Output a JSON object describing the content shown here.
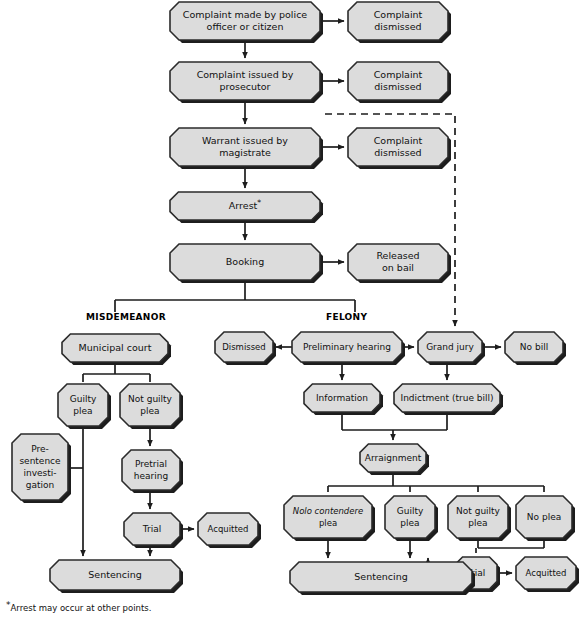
{
  "diagram": {
    "footnote_marker": "*",
    "footnote_text": "Arrest may occur at other points.",
    "colors": {
      "node_fill": "#dcdcdc",
      "node_stroke": "#2b2b2b",
      "shadow": "#1d1d1d",
      "connector": "#1d1d1d",
      "background": "#ffffff",
      "text": "#111111"
    }
  },
  "branch_labels": [
    {
      "id": "misdemeanor",
      "text": "MISDEMEANOR",
      "x": 86,
      "y": 320
    },
    {
      "id": "felony",
      "text": "FELONY",
      "x": 326,
      "y": 320
    }
  ],
  "nodes": [
    {
      "id": "complaint-made",
      "lines": [
        "Complaint made by police",
        "officer or citizen"
      ],
      "x": 170,
      "y": 2,
      "w": 150,
      "h": 38,
      "font": 9.5
    },
    {
      "id": "complaint-dismissed-1",
      "lines": [
        "Complaint",
        "dismissed"
      ],
      "x": 348,
      "y": 2,
      "w": 100,
      "h": 38,
      "font": 9.5
    },
    {
      "id": "complaint-issued",
      "lines": [
        "Complaint issued by",
        "prosecutor"
      ],
      "x": 170,
      "y": 62,
      "w": 150,
      "h": 38,
      "font": 9.5
    },
    {
      "id": "complaint-dismissed-2",
      "lines": [
        "Complaint",
        "dismissed"
      ],
      "x": 348,
      "y": 62,
      "w": 100,
      "h": 38,
      "font": 9.5
    },
    {
      "id": "warrant-issued",
      "lines": [
        "Warrant issued by",
        "magistrate"
      ],
      "x": 170,
      "y": 128,
      "w": 150,
      "h": 38,
      "font": 9.5
    },
    {
      "id": "complaint-dismissed-3",
      "lines": [
        "Complaint",
        "dismissed"
      ],
      "x": 348,
      "y": 128,
      "w": 100,
      "h": 38,
      "font": 9.5
    },
    {
      "id": "arrest",
      "lines": [
        "Arrest*"
      ],
      "x": 170,
      "y": 192,
      "w": 150,
      "h": 28,
      "font": 9.5
    },
    {
      "id": "booking",
      "lines": [
        "Booking"
      ],
      "x": 170,
      "y": 244,
      "w": 150,
      "h": 36,
      "font": 9.5
    },
    {
      "id": "released-on-bail",
      "lines": [
        "Released",
        "on bail"
      ],
      "x": 348,
      "y": 244,
      "w": 100,
      "h": 36,
      "font": 9.5
    },
    {
      "id": "municipal-court",
      "lines": [
        "Municipal court"
      ],
      "x": 62,
      "y": 334,
      "w": 106,
      "h": 28,
      "font": 9.5
    },
    {
      "id": "dismissed",
      "lines": [
        "Dismissed"
      ],
      "x": 215,
      "y": 332,
      "w": 58,
      "h": 30,
      "font": 8.5
    },
    {
      "id": "preliminary-hearing",
      "lines": [
        "Preliminary hearing"
      ],
      "x": 292,
      "y": 332,
      "w": 110,
      "h": 30,
      "font": 9
    },
    {
      "id": "grand-jury",
      "lines": [
        "Grand jury"
      ],
      "x": 418,
      "y": 332,
      "w": 64,
      "h": 30,
      "font": 9
    },
    {
      "id": "no-bill",
      "lines": [
        "No bill"
      ],
      "x": 505,
      "y": 332,
      "w": 58,
      "h": 30,
      "font": 9
    },
    {
      "id": "guilty-plea-misd",
      "lines": [
        "Guilty",
        "plea"
      ],
      "x": 58,
      "y": 384,
      "w": 50,
      "h": 42,
      "font": 9
    },
    {
      "id": "not-guilty-plea-misd",
      "lines": [
        "Not guilty",
        "plea"
      ],
      "x": 120,
      "y": 384,
      "w": 60,
      "h": 42,
      "font": 9
    },
    {
      "id": "information",
      "lines": [
        "Information"
      ],
      "x": 304,
      "y": 384,
      "w": 76,
      "h": 28,
      "font": 9
    },
    {
      "id": "indictment",
      "lines": [
        "Indictment (true bill)"
      ],
      "x": 394,
      "y": 384,
      "w": 106,
      "h": 28,
      "font": 9
    },
    {
      "id": "presentence-investigation",
      "lines": [
        "Pre-",
        "sentence",
        "investi-",
        "gation"
      ],
      "x": 12,
      "y": 434,
      "w": 56,
      "h": 66,
      "font": 9
    },
    {
      "id": "arraignment",
      "lines": [
        "Arraignment"
      ],
      "x": 360,
      "y": 444,
      "w": 66,
      "h": 28,
      "font": 9
    },
    {
      "id": "pretrial-hearing",
      "lines": [
        "Pretrial",
        "hearing"
      ],
      "x": 122,
      "y": 450,
      "w": 58,
      "h": 40,
      "font": 9
    },
    {
      "id": "nolo-contendere-plea",
      "lines": [
        "Nolo contendere",
        "plea"
      ],
      "x": 284,
      "y": 496,
      "w": 88,
      "h": 42,
      "font": 8.5,
      "italic_first_line": true
    },
    {
      "id": "guilty-plea-felony",
      "lines": [
        "Guilty",
        "plea"
      ],
      "x": 385,
      "y": 496,
      "w": 50,
      "h": 42,
      "font": 9
    },
    {
      "id": "not-guilty-plea-felony",
      "lines": [
        "Not guilty",
        "plea"
      ],
      "x": 448,
      "y": 496,
      "w": 60,
      "h": 42,
      "font": 9
    },
    {
      "id": "no-plea",
      "lines": [
        "No plea"
      ],
      "x": 516,
      "y": 496,
      "w": 56,
      "h": 42,
      "font": 9
    },
    {
      "id": "trial-misd",
      "lines": [
        "Trial"
      ],
      "x": 124,
      "y": 513,
      "w": 56,
      "h": 32,
      "font": 9
    },
    {
      "id": "acquitted-misd",
      "lines": [
        "Acquitted"
      ],
      "x": 198,
      "y": 513,
      "w": 60,
      "h": 32,
      "font": 8.5
    },
    {
      "id": "trial-felony",
      "lines": [
        "Trial"
      ],
      "x": 455,
      "y": 557,
      "w": 42,
      "h": 32,
      "font": 9
    },
    {
      "id": "acquitted-felony",
      "lines": [
        "Acquitted"
      ],
      "x": 516,
      "y": 557,
      "w": 60,
      "h": 32,
      "font": 8.5
    },
    {
      "id": "sentencing-misd",
      "lines": [
        "Sentencing"
      ],
      "x": 50,
      "y": 560,
      "w": 130,
      "h": 30,
      "font": 9.5
    },
    {
      "id": "sentencing-felony",
      "lines": [
        "Sentencing"
      ],
      "x": 290,
      "y": 562,
      "w": 182,
      "h": 30,
      "font": 9.5
    }
  ],
  "connectors": [
    {
      "id": "complaint-made-to-dismissed-1",
      "type": "arrow",
      "path": "M 320 21 L 344 21"
    },
    {
      "id": "complaint-made-to-issued",
      "type": "arrow",
      "path": "M 245 40 L 245 58"
    },
    {
      "id": "complaint-issued-to-dismissed-2",
      "type": "arrow",
      "path": "M 320 81 L 344 81"
    },
    {
      "id": "complaint-issued-to-warrant",
      "type": "arrow",
      "path": "M 245 100 L 245 124"
    },
    {
      "id": "warrant-to-dismissed-3",
      "type": "arrow",
      "path": "M 320 147 L 344 147"
    },
    {
      "id": "warrant-to-arrest",
      "type": "arrow",
      "path": "M 245 166 L 245 188"
    },
    {
      "id": "arrest-to-booking",
      "type": "arrow",
      "path": "M 245 220 L 245 240"
    },
    {
      "id": "booking-to-released",
      "type": "arrow",
      "path": "M 320 262 L 344 262"
    },
    {
      "id": "booking-to-split",
      "type": "plain",
      "path": "M 245 280 L 245 300"
    },
    {
      "id": "split-bar",
      "type": "plain",
      "path": "M 115 300 L 355 300"
    },
    {
      "id": "split-to-misdemeanor",
      "type": "plain",
      "path": "M 115 300 L 115 312"
    },
    {
      "id": "split-to-felony",
      "type": "plain",
      "path": "M 355 300 L 355 312"
    },
    {
      "id": "dashed-prosecutor-to-grand-jury",
      "type": "dashed-arrow",
      "path": "M 325 114 L 455 114 L 455 326"
    },
    {
      "id": "municipal-court-to-bar",
      "type": "plain",
      "path": "M 115 362 L 115 374"
    },
    {
      "id": "municipal-bar",
      "type": "plain",
      "path": "M 83 374 L 150 374"
    },
    {
      "id": "bar-to-guilty-plea-misd",
      "type": "plain",
      "path": "M 83 374 L 83 382"
    },
    {
      "id": "bar-to-not-guilty-plea-misd",
      "type": "plain",
      "path": "M 150 374 L 150 382"
    },
    {
      "id": "preliminary-to-dismissed",
      "type": "arrow",
      "path": "M 292 347 L 276 347"
    },
    {
      "id": "preliminary-to-grand-jury",
      "type": "arrow",
      "path": "M 402 347 L 414 347"
    },
    {
      "id": "grand-jury-to-no-bill",
      "type": "arrow",
      "path": "M 482 347 L 501 347"
    },
    {
      "id": "preliminary-to-information",
      "type": "arrow",
      "path": "M 342 362 L 342 380"
    },
    {
      "id": "grand-jury-to-indictment",
      "type": "arrow",
      "path": "M 447 362 L 447 380"
    },
    {
      "id": "not-guilty-misd-to-pretrial",
      "type": "arrow",
      "path": "M 150 426 L 150 446"
    },
    {
      "id": "guilty-plea-misd-down",
      "type": "plain",
      "path": "M 83 426 L 83 468"
    },
    {
      "id": "guilty-misd-to-presentence-bar",
      "type": "plain",
      "path": "M 83 468 L 68 468"
    },
    {
      "id": "guilty-misd-to-sentencing",
      "type": "arrow",
      "path": "M 83 468 L 83 556"
    },
    {
      "id": "information-down",
      "type": "plain",
      "path": "M 342 412 L 342 430"
    },
    {
      "id": "indictment-down",
      "type": "plain",
      "path": "M 447 412 L 447 430"
    },
    {
      "id": "information-indictment-bar",
      "type": "plain",
      "path": "M 342 430 L 447 430"
    },
    {
      "id": "bar-to-arraignment",
      "type": "arrow",
      "path": "M 393 430 L 393 440"
    },
    {
      "id": "arraignment-down",
      "type": "plain",
      "path": "M 393 472 L 393 486"
    },
    {
      "id": "arraignment-plea-bar",
      "type": "plain",
      "path": "M 328 486 L 544 486"
    },
    {
      "id": "bar-to-nolo",
      "type": "plain",
      "path": "M 328 486 L 328 492"
    },
    {
      "id": "bar-to-guilty-felony",
      "type": "plain",
      "path": "M 410 486 L 410 492"
    },
    {
      "id": "bar-to-not-guilty-felony",
      "type": "plain",
      "path": "M 478 486 L 478 492"
    },
    {
      "id": "bar-to-no-plea",
      "type": "plain",
      "path": "M 544 486 L 544 492"
    },
    {
      "id": "pretrial-to-trial-misd",
      "type": "arrow",
      "path": "M 150 490 L 150 509"
    },
    {
      "id": "trial-misd-to-acquitted",
      "type": "arrow",
      "path": "M 180 529 L 194 529"
    },
    {
      "id": "trial-misd-to-sentencing",
      "type": "arrow",
      "path": "M 150 545 L 150 556"
    },
    {
      "id": "nolo-to-sentencing",
      "type": "arrow",
      "path": "M 328 538 L 328 558"
    },
    {
      "id": "guilty-felony-to-sentencing",
      "type": "arrow",
      "path": "M 410 538 L 410 558"
    },
    {
      "id": "not-guilty-felony-down",
      "type": "plain",
      "path": "M 478 538 L 478 548"
    },
    {
      "id": "no-plea-down",
      "type": "plain",
      "path": "M 544 538 L 544 548"
    },
    {
      "id": "plea-to-trial-bar",
      "type": "plain",
      "path": "M 478 548 L 544 548"
    },
    {
      "id": "bar-to-trial-felony",
      "type": "plain",
      "path": "M 476 548 L 476 553"
    },
    {
      "id": "trial-felony-to-acquitted",
      "type": "arrow",
      "path": "M 497 573 L 512 573"
    },
    {
      "id": "trial-felony-to-sentencing",
      "type": "arrow",
      "path": "M 455 573 L 428 573 L 428 558"
    }
  ]
}
